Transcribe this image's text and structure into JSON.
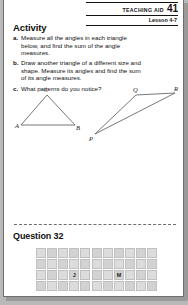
{
  "page": {
    "background_color": "#b9b9b9",
    "sheet_color": "#ffffff"
  },
  "header": {
    "teaching_aid_label": "TEACHING AID",
    "teaching_aid_number": "41",
    "lesson_label": "Lesson 4-7"
  },
  "activity": {
    "title": "Activity",
    "items": [
      {
        "letter": "a.",
        "text": "Measure all the angles in each triangle below, and find the sum of the angle measures."
      },
      {
        "letter": "b.",
        "text": "Draw another triangle of a different size and shape. Measure its angles and find the sum of its angle measures."
      },
      {
        "letter": "c.",
        "text": "What patterns do you notice?"
      }
    ]
  },
  "figures": [
    {
      "name": "triangle-abc",
      "vertices": [
        {
          "label": "A",
          "x": 6,
          "y": 44
        },
        {
          "label": "B",
          "x": 62,
          "y": 44
        },
        {
          "label": "C",
          "x": 34,
          "y": 13
        }
      ]
    },
    {
      "name": "triangle-pqr",
      "vertices": [
        {
          "label": "P",
          "x": 4,
          "y": 49
        },
        {
          "label": "Q",
          "x": 46,
          "y": 10
        },
        {
          "label": "R",
          "x": 86,
          "y": 8
        }
      ]
    }
  ],
  "question": {
    "title": "Question 32",
    "grid": {
      "columns": 11,
      "rows": 4,
      "cells": [
        [
          "",
          "",
          "",
          "",
          "",
          "",
          "",
          "",
          "",
          "",
          ""
        ],
        [
          "",
          "",
          "",
          "",
          "",
          "",
          "",
          "",
          "",
          "",
          ""
        ],
        [
          "",
          "",
          "",
          "J",
          "",
          "",
          "",
          "M",
          "",
          "",
          ""
        ],
        [
          "",
          "",
          "",
          "",
          "",
          "",
          "",
          "",
          "",
          "",
          ""
        ]
      ]
    }
  }
}
